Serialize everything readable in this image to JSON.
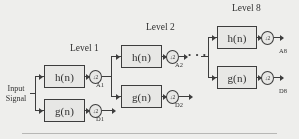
{
  "diagram": {
    "input": {
      "line1": "Input",
      "line2": "Signal"
    },
    "levels": [
      {
        "label": "Level 1"
      },
      {
        "label": "Level 2"
      },
      {
        "label": "Level 8"
      }
    ],
    "filters": {
      "lowpass": "h(n)",
      "highpass": "g(n)"
    },
    "downsampler": "↓2",
    "outputs": {
      "a1": "A1",
      "d1": "D1",
      "a2": "A2",
      "d2": "D2",
      "a8": "A8",
      "d8": "D8"
    },
    "ellipsis": "• • •",
    "colors": {
      "stroke": "#3a3a3a",
      "background": "#f3f3f1",
      "box_fill": "#ebebe9",
      "text": "#2b2b2b"
    }
  }
}
